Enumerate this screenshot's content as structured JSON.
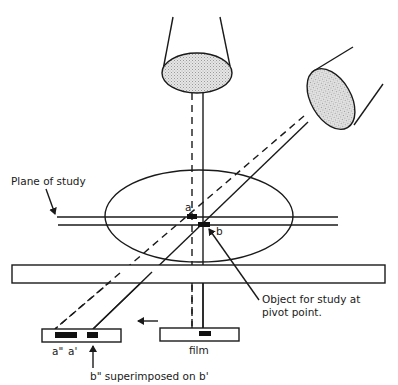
{
  "diagram": {
    "colors": {
      "line": "#1a1a1a",
      "tube_fill": "#d9d9d9",
      "marker": "#111111",
      "background": "#ffffff"
    },
    "labels": {
      "plane_of_study": "Plane of study",
      "point_a": "a",
      "point_b": "b",
      "object_line1": "Object for study at",
      "object_line2": "pivot point.",
      "film": "film",
      "a_double_prime": "a\"",
      "a_prime": "a'",
      "superimposed": "b\" superimposed on b'"
    },
    "components": [
      {
        "id": "xray-tube-vertical",
        "description": "X-ray tube, vertical position"
      },
      {
        "id": "xray-tube-angled",
        "description": "X-ray tube, angled position"
      },
      {
        "id": "patient-body-ellipse",
        "description": "Patient body cross-section"
      },
      {
        "id": "table",
        "description": "Examination table"
      },
      {
        "id": "film-initial",
        "description": "Film in initial position"
      },
      {
        "id": "film-moved",
        "description": "Film after movement (arrow indicates direction left)"
      }
    ]
  }
}
